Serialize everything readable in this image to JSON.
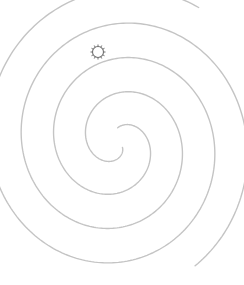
{
  "diagram": {
    "type": "double-spiral",
    "canvas": {
      "width": 244,
      "height": 285,
      "background": "#ffffff"
    },
    "center": {
      "x": 118,
      "y": 143
    },
    "stroke_color": "#c4c4c4",
    "arms": [
      {
        "name": "arm-a",
        "theta_start": 0.2,
        "theta_end": 13.0,
        "phase": 0.0
      },
      {
        "name": "arm-b",
        "theta_start": 1.0,
        "theta_end": 14.15,
        "phase": 3.14159
      }
    ],
    "spiral": {
      "a": 4.0,
      "b": 10.4
    },
    "marker": {
      "icon": "sun-gear-icon",
      "x": 98,
      "y": 52,
      "radius": 5.5,
      "spokes": 12,
      "spoke_length": 2,
      "color": "#6e6e6e"
    }
  }
}
